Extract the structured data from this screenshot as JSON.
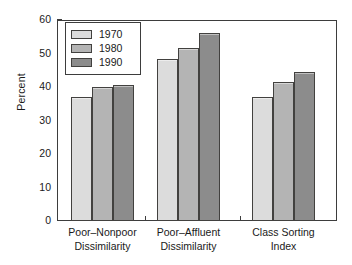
{
  "chart_data": {
    "type": "bar",
    "title": "",
    "xlabel": "",
    "ylabel": "Percent",
    "ylim": [
      0,
      60
    ],
    "yticks": [
      0,
      10,
      20,
      30,
      40,
      50,
      60
    ],
    "grid": false,
    "legend_position": "upper-left",
    "categories": [
      "Poor–Nonpoor\nDissimilarity",
      "Poor–Affluent\nDissimilarity",
      "Class Sorting\nIndex"
    ],
    "series": [
      {
        "name": "1970",
        "color": "#dcdcdc",
        "values": [
          37.0,
          48.5,
          37.0
        ]
      },
      {
        "name": "1980",
        "color": "#b4b4b4",
        "values": [
          40.0,
          51.5,
          41.5
        ]
      },
      {
        "name": "1990",
        "color": "#8c8c8c",
        "values": [
          40.5,
          56.0,
          44.5
        ]
      }
    ]
  },
  "axis": {
    "y_title": "Percent",
    "y_tick_labels": [
      "0",
      "10",
      "20",
      "30",
      "40",
      "50",
      "60"
    ]
  },
  "legend": {
    "entries": [
      {
        "label": "1970",
        "color": "#dcdcdc"
      },
      {
        "label": "1980",
        "color": "#b4b4b4"
      },
      {
        "label": "1990",
        "color": "#8c8c8c"
      }
    ]
  },
  "style": {
    "frame_color": "#3d3d3d",
    "bar_edge_color": "#42413f",
    "background": "#ffffff"
  }
}
